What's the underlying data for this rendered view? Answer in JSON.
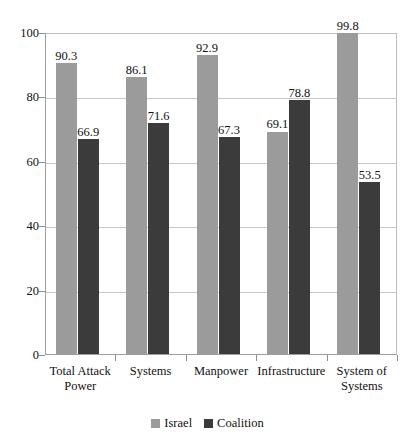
{
  "chart_data": {
    "type": "bar",
    "title": "",
    "subtitle": "",
    "xlabel": "",
    "ylabel": "",
    "ylim": [
      0,
      100
    ],
    "yticks": [
      0,
      20,
      40,
      60,
      80,
      100
    ],
    "ytick_labels": [
      "0",
      "20",
      "40",
      "60",
      "80",
      "100"
    ],
    "grid": true,
    "legend_position": "bottom-center",
    "categories": [
      "Total Attack\nPower",
      "Systems",
      "Manpower",
      "Infrastructure",
      "System of\nSystems"
    ],
    "series": [
      {
        "name": "Israel",
        "color": "#9b9b9b",
        "values": [
          90.3,
          86.1,
          92.9,
          69.1,
          99.8
        ],
        "labels": [
          "90.3",
          "86.1",
          "92.9",
          "69.1",
          "99.8"
        ]
      },
      {
        "name": "Coalition",
        "color": "#3b3b3b",
        "values": [
          66.9,
          71.6,
          67.3,
          78.8,
          53.5
        ],
        "labels": [
          "66.9",
          "71.6",
          "67.3",
          "78.8",
          "53.5"
        ]
      }
    ]
  },
  "legend": {
    "items": [
      {
        "label": "Israel",
        "color": "#9b9b9b"
      },
      {
        "label": "Coalition",
        "color": "#3b3b3b"
      }
    ]
  },
  "artifact": {
    "top_clipped_text": "··   ·   ·"
  },
  "colors": {
    "series_israel": "#9b9b9b",
    "series_coalition": "#3b3b3b",
    "gridline": "#c6c6c6",
    "axis": "#9d9d9d",
    "text": "#111111",
    "background": "#ffffff"
  }
}
